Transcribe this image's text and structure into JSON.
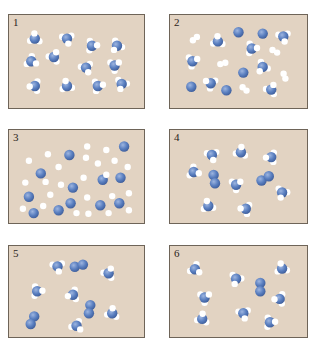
{
  "figure": {
    "colors": {
      "background": "#e2d3c2",
      "border": "#6e6458",
      "nitrogen": "#5a7fc0",
      "nitrogen_highlight": "#9db5e0",
      "nitrogen_shadow": "#3d5c99",
      "hydrogen": "#ffffff"
    },
    "legend_semantics": {
      "blue_sphere": "N atom",
      "white_sphere": "H atom"
    },
    "panels": [
      {
        "label": "1",
        "description": "12 NH3 molecules",
        "molecules": [
          {
            "type": "NH3",
            "x": 0.15,
            "y": 0.22,
            "rot": 30
          },
          {
            "type": "NH3",
            "x": 0.42,
            "y": 0.22,
            "rot": 200
          },
          {
            "type": "NH3",
            "x": 0.63,
            "y": 0.32,
            "rot": 120
          },
          {
            "type": "NH3",
            "x": 0.84,
            "y": 0.32,
            "rot": 250
          },
          {
            "type": "NH3",
            "x": 0.12,
            "y": 0.54,
            "rot": 150
          },
          {
            "type": "NH3",
            "x": 0.31,
            "y": 0.48,
            "rot": 60
          },
          {
            "type": "NH3",
            "x": 0.58,
            "y": 0.63,
            "rot": 190
          },
          {
            "type": "NH3",
            "x": 0.82,
            "y": 0.6,
            "rot": 90
          },
          {
            "type": "NH3",
            "x": 0.15,
            "y": 0.89,
            "rot": 300
          },
          {
            "type": "NH3",
            "x": 0.42,
            "y": 0.89,
            "rot": 20
          },
          {
            "type": "NH3",
            "x": 0.68,
            "y": 0.89,
            "rot": 110
          },
          {
            "type": "NH3",
            "x": 0.88,
            "y": 0.86,
            "rot": 230
          }
        ]
      },
      {
        "label": "2",
        "description": "NH3, free N atoms and H2 molecules",
        "molecules": [
          {
            "type": "H2",
            "x": 0.14,
            "y": 0.22,
            "rot": -40
          },
          {
            "type": "NH3",
            "x": 0.33,
            "y": 0.26,
            "rot": 30
          },
          {
            "type": "N",
            "x": 0.5,
            "y": 0.13
          },
          {
            "type": "N",
            "x": 0.7,
            "y": 0.15
          },
          {
            "type": "NH3",
            "x": 0.87,
            "y": 0.19,
            "rot": 200
          },
          {
            "type": "NH3",
            "x": 0.61,
            "y": 0.36,
            "rot": 120
          },
          {
            "type": "H2",
            "x": 0.8,
            "y": 0.4,
            "rot": 30
          },
          {
            "type": "NH3",
            "x": 0.12,
            "y": 0.54,
            "rot": 100
          },
          {
            "type": "H2",
            "x": 0.37,
            "y": 0.57,
            "rot": -15
          },
          {
            "type": "N",
            "x": 0.54,
            "y": 0.7
          },
          {
            "type": "NH3",
            "x": 0.7,
            "y": 0.62,
            "rot": 250
          },
          {
            "type": "H2",
            "x": 0.88,
            "y": 0.75,
            "rot": 70
          },
          {
            "type": "N",
            "x": 0.11,
            "y": 0.9
          },
          {
            "type": "NH3",
            "x": 0.27,
            "y": 0.85,
            "rot": 330
          },
          {
            "type": "N",
            "x": 0.4,
            "y": 0.95
          },
          {
            "type": "H2",
            "x": 0.55,
            "y": 0.93,
            "rot": 40
          },
          {
            "type": "NH3",
            "x": 0.77,
            "y": 0.94,
            "rot": 60
          }
        ]
      },
      {
        "label": "3",
        "description": "Free N atoms and free H atoms",
        "molecules": [
          {
            "type": "N",
            "x": 0.9,
            "y": 0.12
          },
          {
            "type": "N",
            "x": 0.44,
            "y": 0.24
          },
          {
            "type": "N",
            "x": 0.2,
            "y": 0.5
          },
          {
            "type": "N",
            "x": 0.72,
            "y": 0.59
          },
          {
            "type": "N",
            "x": 0.87,
            "y": 0.56
          },
          {
            "type": "N",
            "x": 0.47,
            "y": 0.7
          },
          {
            "type": "N",
            "x": 0.1,
            "y": 0.83
          },
          {
            "type": "N",
            "x": 0.45,
            "y": 0.92
          },
          {
            "type": "N",
            "x": 0.7,
            "y": 0.95
          },
          {
            "type": "N",
            "x": 0.86,
            "y": 0.92
          },
          {
            "type": "N",
            "x": 0.14,
            "y": 1.06
          },
          {
            "type": "N",
            "x": 0.35,
            "y": 1.02
          },
          {
            "type": "H",
            "x": 0.59,
            "y": 0.12
          },
          {
            "type": "H",
            "x": 0.75,
            "y": 0.17
          },
          {
            "type": "H",
            "x": 0.26,
            "y": 0.23
          },
          {
            "type": "H",
            "x": 0.1,
            "y": 0.32
          },
          {
            "type": "H",
            "x": 0.58,
            "y": 0.28
          },
          {
            "type": "H",
            "x": 0.68,
            "y": 0.36
          },
          {
            "type": "H",
            "x": 0.82,
            "y": 0.32
          },
          {
            "type": "H",
            "x": 0.35,
            "y": 0.41
          },
          {
            "type": "H",
            "x": 0.93,
            "y": 0.41
          },
          {
            "type": "H",
            "x": 0.56,
            "y": 0.56
          },
          {
            "type": "H",
            "x": 0.75,
            "y": 0.52
          },
          {
            "type": "H",
            "x": 0.07,
            "y": 0.63
          },
          {
            "type": "H",
            "x": 0.24,
            "y": 0.62
          },
          {
            "type": "H",
            "x": 0.37,
            "y": 0.66
          },
          {
            "type": "H",
            "x": 0.28,
            "y": 0.8
          },
          {
            "type": "H",
            "x": 0.59,
            "y": 0.84
          },
          {
            "type": "H",
            "x": 0.8,
            "y": 0.82
          },
          {
            "type": "H",
            "x": 0.94,
            "y": 0.78
          },
          {
            "type": "H",
            "x": 0.22,
            "y": 0.96
          },
          {
            "type": "H",
            "x": 0.05,
            "y": 1.0
          },
          {
            "type": "H",
            "x": 0.5,
            "y": 1.06
          },
          {
            "type": "H",
            "x": 0.6,
            "y": 1.07
          },
          {
            "type": "H",
            "x": 0.77,
            "y": 1.06
          },
          {
            "type": "H",
            "x": 0.94,
            "y": 1.02
          }
        ]
      },
      {
        "label": "4",
        "description": "8 NH3 molecules and 2 N2 molecules",
        "molecules": [
          {
            "type": "NH3",
            "x": 0.28,
            "y": 0.24,
            "rot": 200
          },
          {
            "type": "NH3",
            "x": 0.52,
            "y": 0.2,
            "rot": 40
          },
          {
            "type": "NH3",
            "x": 0.77,
            "y": 0.27,
            "rot": 300
          },
          {
            "type": "NH3",
            "x": 0.13,
            "y": 0.48,
            "rot": 140
          },
          {
            "type": "N2",
            "x": 0.3,
            "y": 0.58,
            "rot": 80
          },
          {
            "type": "NH3",
            "x": 0.48,
            "y": 0.66,
            "rot": 90
          },
          {
            "type": "N2",
            "x": 0.72,
            "y": 0.57,
            "rot": -30
          },
          {
            "type": "NH3",
            "x": 0.86,
            "y": 0.77,
            "rot": 230
          },
          {
            "type": "NH3",
            "x": 0.25,
            "y": 0.96,
            "rot": 20
          },
          {
            "type": "NH3",
            "x": 0.56,
            "y": 1.0,
            "rot": 310
          }
        ]
      },
      {
        "label": "5",
        "description": "6 NH3 molecules and 3 N2 molecules",
        "molecules": [
          {
            "type": "NH3",
            "x": 0.34,
            "y": 0.18,
            "rot": 200
          },
          {
            "type": "N2",
            "x": 0.52,
            "y": 0.17,
            "rot": -15
          },
          {
            "type": "NH3",
            "x": 0.77,
            "y": 0.28,
            "rot": 60
          },
          {
            "type": "NH3",
            "x": 0.17,
            "y": 0.54,
            "rot": 120
          },
          {
            "type": "NH3",
            "x": 0.47,
            "y": 0.59,
            "rot": 290
          },
          {
            "type": "N2",
            "x": 0.61,
            "y": 0.8,
            "rot": 100
          },
          {
            "type": "NH3",
            "x": 0.8,
            "y": 0.86,
            "rot": 40
          },
          {
            "type": "N2",
            "x": 0.13,
            "y": 0.96,
            "rot": 115
          },
          {
            "type": "NH3",
            "x": 0.5,
            "y": 1.04,
            "rot": 170
          }
        ]
      },
      {
        "label": "6",
        "description": "8 NH3 molecules and 1 N2 molecule",
        "molecules": [
          {
            "type": "NH3",
            "x": 0.14,
            "y": 0.22,
            "rot": 160
          },
          {
            "type": "NH3",
            "x": 0.48,
            "y": 0.36,
            "rot": 230
          },
          {
            "type": "N2",
            "x": 0.68,
            "y": 0.48,
            "rot": 90
          },
          {
            "type": "NH3",
            "x": 0.86,
            "y": 0.21,
            "rot": 20
          },
          {
            "type": "NH3",
            "x": 0.22,
            "y": 0.63,
            "rot": 90
          },
          {
            "type": "NH3",
            "x": 0.84,
            "y": 0.65,
            "rot": 300
          },
          {
            "type": "NH3",
            "x": 0.2,
            "y": 0.94,
            "rot": 40
          },
          {
            "type": "NH3",
            "x": 0.54,
            "y": 0.86,
            "rot": 200
          },
          {
            "type": "NH3",
            "x": 0.76,
            "y": 0.99,
            "rot": 120
          }
        ]
      }
    ]
  }
}
